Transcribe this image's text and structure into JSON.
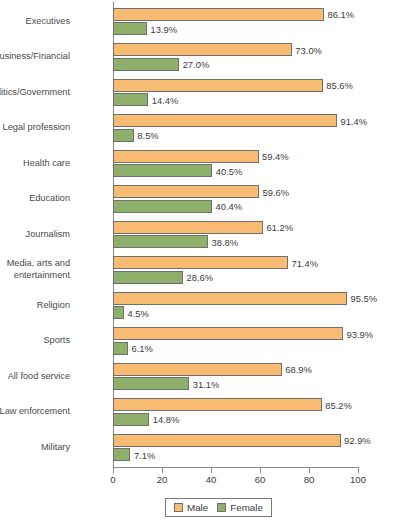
{
  "chart_data": {
    "type": "bar",
    "orientation": "horizontal",
    "title": "",
    "subtitle": "",
    "xlabel": "",
    "ylabel": "",
    "xlim": [
      0,
      100
    ],
    "xticks": [
      "0",
      "20",
      "40",
      "60",
      "80",
      "100"
    ],
    "grid": false,
    "legend_position": "bottom",
    "value_suffix": "%",
    "categories": [
      "Executives",
      "Business/Financial",
      "Politics/Government",
      "Legal profession",
      "Health care",
      "Education",
      "Journalism",
      "Media, arts and\nentertainment",
      "Religion",
      "Sports",
      "All food service",
      "Law enforcement",
      "Military"
    ],
    "series": [
      {
        "name": "Male",
        "color": "#F7BC72",
        "values": [
          86.1,
          73.0,
          85.6,
          91.4,
          59.4,
          59.6,
          61.2,
          71.4,
          95.5,
          93.9,
          68.9,
          85.2,
          92.9
        ],
        "labels": [
          "86.1%",
          "73.0%",
          "85.6%",
          "91.4%",
          "59.4%",
          "59.6%",
          "61.2%",
          "71.4%",
          "95.5%",
          "93.9%",
          "68.9%",
          "85.2%",
          "92.9%"
        ]
      },
      {
        "name": "Female",
        "color": "#8FB06B",
        "values": [
          13.9,
          27.0,
          14.4,
          8.5,
          40.5,
          40.4,
          38.8,
          28.6,
          4.5,
          6.1,
          31.1,
          14.8,
          7.1
        ],
        "labels": [
          "13.9%",
          "27.0%",
          "14.4%",
          "8.5%",
          "40.5%",
          "40.4%",
          "38.8%",
          "28.6%",
          "4.5%",
          "6.1%",
          "31.1%",
          "14.8%",
          "7.1%"
        ]
      }
    ],
    "legend": [
      "Male",
      "Female"
    ]
  }
}
